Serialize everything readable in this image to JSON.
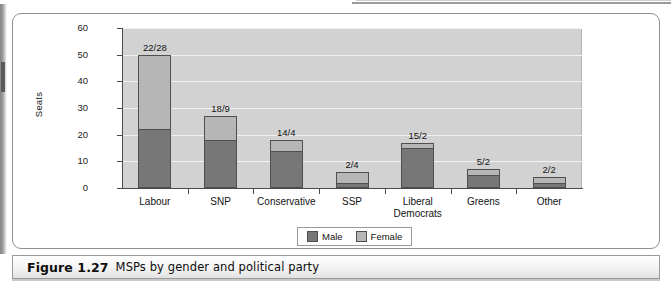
{
  "caption": {
    "number": "Figure 1.27",
    "text": "MSPs by gender and political party"
  },
  "chart_data": {
    "type": "bar",
    "subtype": "stacked",
    "title": "",
    "xlabel": "",
    "ylabel": "Seats",
    "ylim": [
      0,
      60
    ],
    "ytick_values": [
      0,
      10,
      20,
      30,
      40,
      50,
      60
    ],
    "ytick_labels": [
      "0",
      "10",
      "20",
      "30",
      "40",
      "50",
      "60"
    ],
    "grid": true,
    "grid_axis": "y",
    "legend_position": "bottom-center",
    "categories": [
      "Labour",
      "SNP",
      "Conservative",
      "SSP",
      "Liberal Democrats",
      "Greens",
      "Other"
    ],
    "category_label_lines": [
      [
        "Labour"
      ],
      [
        "SNP"
      ],
      [
        "Conservative"
      ],
      [
        "SSP"
      ],
      [
        "Liberal",
        "Democrats"
      ],
      [
        "Greens"
      ],
      [
        "Other"
      ]
    ],
    "series": [
      {
        "name": "Male",
        "color": "#777777",
        "values": [
          22,
          18,
          14,
          2,
          15,
          5,
          2
        ]
      },
      {
        "name": "Female",
        "color": "#b6b6b6",
        "values": [
          28,
          9,
          4,
          4,
          2,
          2,
          2
        ]
      }
    ],
    "totals": [
      50,
      27,
      18,
      6,
      17,
      7,
      4
    ],
    "bar_annotations": [
      "22/28",
      "18/9",
      "14/4",
      "2/4",
      "15/2",
      "5/2",
      "2/2"
    ],
    "annotation_format": "male/female",
    "plot_background": "#d2d2d2",
    "gridline_color": "#f2f2f2",
    "axis_color": "#4a4a4a"
  },
  "legend": {
    "items": [
      {
        "label": "Male"
      },
      {
        "label": "Female"
      }
    ]
  }
}
